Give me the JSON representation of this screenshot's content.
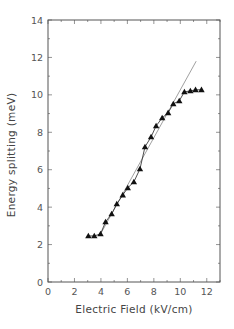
{
  "chart_data": {
    "type": "scatter",
    "title": "",
    "xlabel": "Electric Field (kV/cm)",
    "ylabel": "Energy splitting (meV)",
    "xlim": [
      0,
      13
    ],
    "ylim": [
      0,
      14
    ],
    "xticks": [
      0,
      2,
      4,
      6,
      8,
      10,
      12
    ],
    "yticks": [
      0,
      2,
      4,
      6,
      8,
      10,
      12,
      14
    ],
    "grid": false,
    "legend": null,
    "series": [
      {
        "name": "measured",
        "style": "triangle-markers-connected",
        "color": "#111111",
        "x": [
          3.05,
          3.5,
          3.97,
          4.35,
          4.81,
          5.2,
          5.65,
          6.03,
          6.49,
          6.95,
          7.33,
          7.79,
          8.17,
          8.63,
          9.08,
          9.47,
          9.92,
          10.31,
          10.76,
          11.15,
          11.6
        ],
        "y": [
          2.46,
          2.46,
          2.57,
          3.21,
          3.64,
          4.17,
          4.65,
          5.03,
          5.35,
          6.04,
          7.22,
          7.75,
          8.34,
          8.77,
          9.04,
          9.52,
          9.68,
          10.16,
          10.21,
          10.27,
          10.27
        ]
      },
      {
        "name": "linear fit",
        "style": "thin-line",
        "color": "#888888",
        "x": [
          4.0,
          11.2
        ],
        "y": [
          2.6,
          11.8
        ]
      }
    ]
  }
}
